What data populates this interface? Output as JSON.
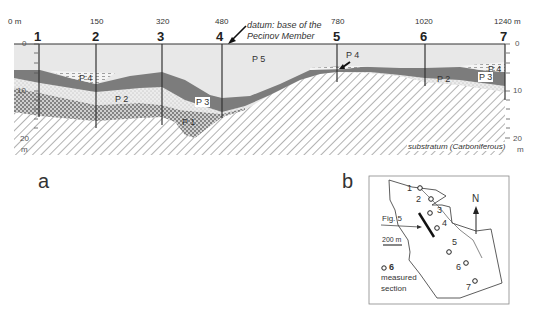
{
  "panel_a": {
    "label": "a",
    "sections": [
      {
        "id": "1",
        "distance": "0 m",
        "x": 14
      },
      {
        "id": "2",
        "distance": "150",
        "x": 96
      },
      {
        "id": "3",
        "distance": "320",
        "x": 162
      },
      {
        "id": "4",
        "distance": "480",
        "x": 222
      },
      {
        "id": "5",
        "distance": "780",
        "x": 337
      },
      {
        "id": "6",
        "distance": "1020",
        "x": 425
      },
      {
        "id": "7",
        "distance": "1240 m",
        "x": 505
      }
    ],
    "depth_axis": {
      "ticks": [
        "0",
        "10",
        "20"
      ],
      "unit": "m"
    },
    "datum_annotation": {
      "line1": "datum: base of the",
      "line2": "Pecinov Member"
    },
    "units": [
      {
        "name": "P 1",
        "fill": "#c9c9c9",
        "pattern": "coarse-dots"
      },
      {
        "name": "P 2",
        "fill": "#e6e6e6",
        "pattern": "fine-dots"
      },
      {
        "name": "P 3",
        "fill": "#7a7a7a",
        "pattern": "solid"
      },
      {
        "name": "P 4",
        "fill": "#f2f2f2",
        "pattern": "dashed"
      },
      {
        "name": "P 5",
        "fill": "#e9e9e9",
        "pattern": "solid-light"
      }
    ],
    "substratum_label": "substratum (Carboniferous)"
  },
  "panel_b": {
    "label": "b",
    "north_label": "N",
    "fig_label": "Fig. 5",
    "scale_label": "200 m",
    "legend": {
      "symbol_number": "6",
      "text_line1": "measured",
      "text_line2": "section"
    },
    "points": [
      {
        "id": "1"
      },
      {
        "id": "2"
      },
      {
        "id": "3"
      },
      {
        "id": "4"
      },
      {
        "id": "5"
      },
      {
        "id": "6"
      },
      {
        "id": "7"
      }
    ]
  }
}
